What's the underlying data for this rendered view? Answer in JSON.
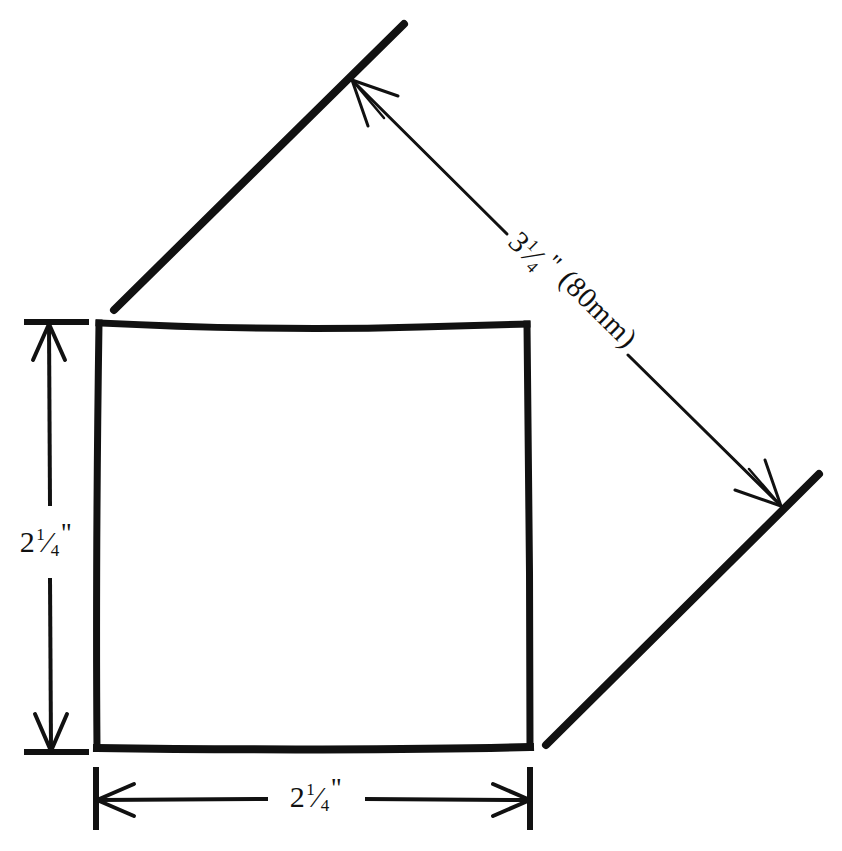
{
  "figure": {
    "background_color": "#ffffff",
    "ink_color": "#000000",
    "shape": {
      "name": "square",
      "style": "hand-drawn heavy outline",
      "corners": {
        "top_left": [
          100,
          323
        ],
        "top_right": [
          527,
          324
        ],
        "bottom_right": [
          530,
          747
        ],
        "bottom_left": [
          97,
          748
        ]
      }
    },
    "dimensions": [
      {
        "id": "height",
        "label_value": "2",
        "label_fraction_numerator": "1",
        "label_fraction_denominator": "4",
        "label_unit": "\"",
        "label_full": "2 1/4\"",
        "orientation": "vertical",
        "position": "left",
        "arrow_style": "double-headed with end ticks"
      },
      {
        "id": "width",
        "label_value": "2",
        "label_fraction_numerator": "1",
        "label_fraction_denominator": "4",
        "label_unit": "\"",
        "label_full": "2 1/4\"",
        "orientation": "horizontal",
        "position": "bottom",
        "arrow_style": "double-headed with end ticks"
      },
      {
        "id": "diagonal",
        "label_value": "3",
        "label_fraction_numerator": "1",
        "label_fraction_denominator": "4",
        "label_unit": "\"",
        "label_metric": "(80mm)",
        "label_full": "3 1/4\" (80mm)",
        "orientation": "diagonal",
        "rotation_degrees": 45,
        "position": "upper-right",
        "arrow_style": "double-headed between extension lines"
      }
    ]
  }
}
